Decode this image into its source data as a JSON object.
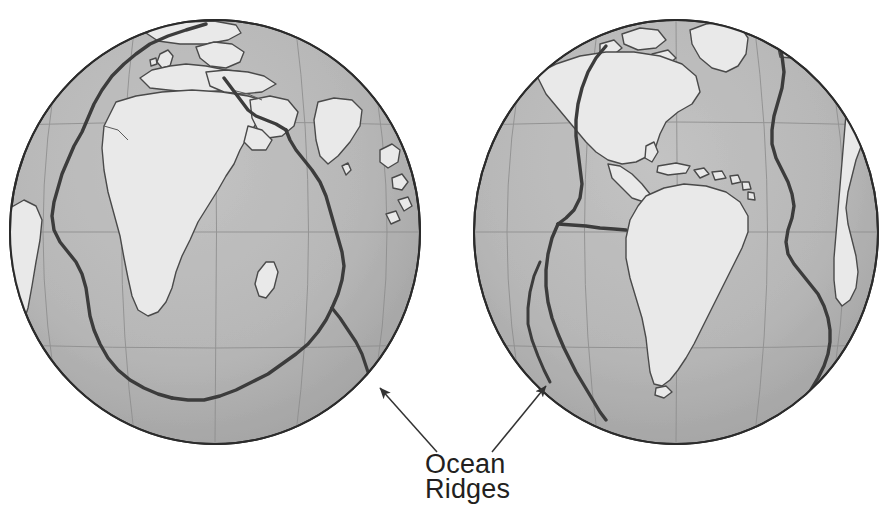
{
  "figure": {
    "kind": "two-hemisphere-globe-map",
    "background_color": "#ffffff",
    "annotation": {
      "label_line_1": "Ocean",
      "label_line_2": "Ridges",
      "text_color": "#231f20",
      "leader_color": "#3a3a3a",
      "leaders": [
        {
          "name": "left-leader",
          "from_x": 437,
          "from_y": 452,
          "to_x": 378,
          "to_y": 386
        },
        {
          "name": "right-leader",
          "from_x": 492,
          "from_y": 452,
          "to_x": 548,
          "to_y": 384
        }
      ]
    },
    "palette": {
      "ocean": "#b9b9b9",
      "ocean_shadow": "#a8a8a8",
      "land": "#e9e9e9",
      "land_highlight": "#f2f2f2",
      "coast_line": "#4a4a4a",
      "graticule": "#8d8d8d",
      "globe_rim": "#2b2b2b",
      "ridge": "#3c3c3c"
    },
    "globes": [
      {
        "name": "left-globe",
        "center_label": "Africa / Eurasia hemisphere",
        "cx": 215,
        "cy": 232,
        "rx": 205,
        "ry": 212,
        "landmasses": [
          "Africa",
          "Europe",
          "Arabia",
          "India",
          "Greenland",
          "South America (edge)",
          "Madagascar",
          "Iceland"
        ],
        "ridges": [
          "Mid-Atlantic Ridge",
          "Southwest Indian Ridge",
          "Central Indian Ridge",
          "Red Sea Rift",
          "Carlsberg Ridge"
        ],
        "graticule": {
          "latitudes": [
            125,
            232,
            345
          ],
          "meridian_count": 5
        }
      },
      {
        "name": "right-globe",
        "center_label": "Americas hemisphere",
        "cx": 676,
        "cy": 232,
        "rx": 202,
        "ry": 212,
        "landmasses": [
          "North America",
          "South America",
          "Greenland",
          "Caribbean islands",
          "Africa (edge)",
          "Europe (edge)"
        ],
        "ridges": [
          "Mid-Atlantic Ridge",
          "East Pacific Rise",
          "Chile Rise",
          "Pacific-Antarctic Ridge"
        ],
        "graticule": {
          "latitudes": [
            125,
            232,
            345
          ],
          "meridian_count": 5
        }
      }
    ]
  }
}
